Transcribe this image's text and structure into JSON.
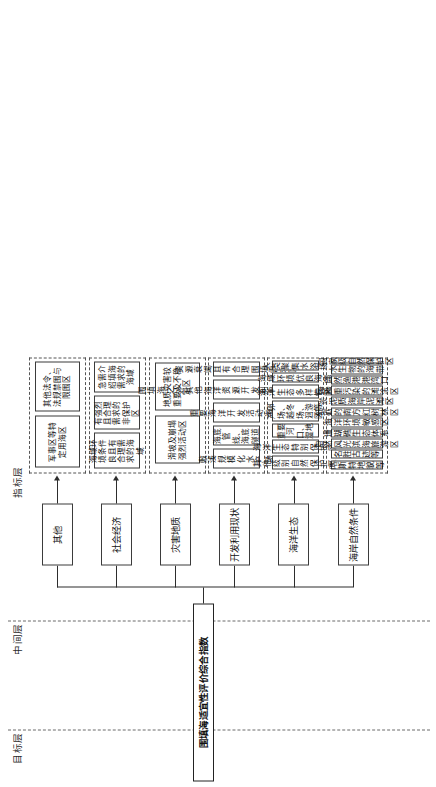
{
  "diagram": {
    "title": "围填海适宜性评价综合指数",
    "layers": [
      {
        "key": "goal",
        "label": "目标层"
      },
      {
        "key": "middle",
        "label": "中间层"
      },
      {
        "key": "indicator",
        "label": "指标层"
      }
    ],
    "branches": [
      {
        "id": "natural",
        "label": "海岸自然条件",
        "indicators": [
          "喀斯特地貌等",
          "名胜古迹等",
          "自然风光滨海旅游区",
          "珊瑚礁生态体系",
          "海洋环境敏感区",
          "砥砺的南方红树林区",
          "淤泥质海岸泥滩区",
          "已严重污染的滩涂区",
          "自然渔港港湾口",
          "水生物的海带",
          "国家级自然保护区"
        ]
      },
      {
        "id": "ecology",
        "label": "海洋生态",
        "indicators": [
          "其他级别自然保护区",
          "海洋生态特别保护区",
          "重要河口、湿地",
          "产卵场、越冬场、洄游区等",
          "海洋生态多样性区",
          "海域环境优良海湾",
          "人类聚集水浴场"
        ]
      },
      {
        "id": "utilization",
        "label": "开发利用现状",
        "indicators": [
          "敷浅规模化水产场",
          "海底管线、海底隧道",
          "重要海洋开发活动海域",
          "围填海之外其他海洋资源开发利用方式进行海域",
          "资源衰竭且有合理围填需求区"
        ]
      },
      {
        "id": "geology",
        "label": "灾害地质",
        "indicators": [
          "滑坡及崩塌强烈活动区",
          "地质灾害较重要及不稳定区"
        ]
      },
      {
        "id": "economy",
        "label": "社会经济",
        "indicators": [
          "海域环境条件良且有合理需求的海域",
          "有强烈且合理需求的非保护区",
          "急需介绍填海需求的海域"
        ]
      },
      {
        "id": "other",
        "label": "其他",
        "indicators": [
          "军事区等特定用海区",
          "其他法令、法规禁围与限围区"
        ]
      }
    ]
  }
}
